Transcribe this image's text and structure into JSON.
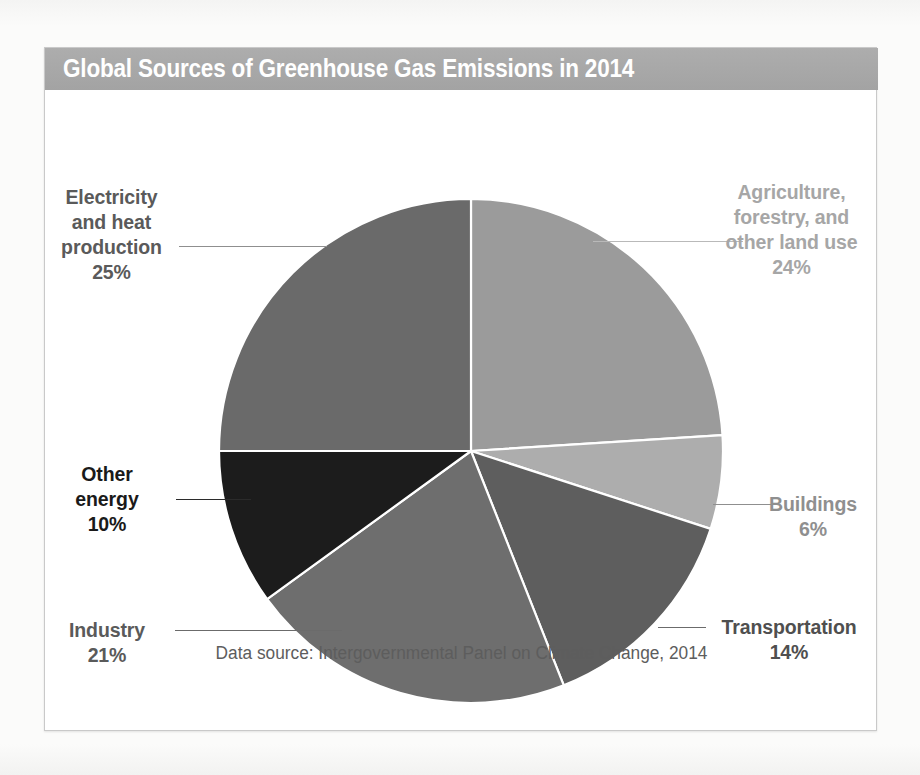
{
  "card": {
    "title": "Global Sources of Greenhouse Gas Emissions in 2014",
    "source_note": "Data source: Intergovernmental Panel on Climate Change, 2014"
  },
  "colors": {
    "banner": "#a8a8a8",
    "banner_text": "#ffffff",
    "card_bg": "#ffffff",
    "card_border": "#c9c9c9",
    "page_bg": "#fbfbfa",
    "slice_separator": "#ffffff",
    "source_note_text": "#5d5d5d"
  },
  "chart_data": {
    "type": "pie",
    "title": "Global Sources of Greenhouse Gas Emissions in 2014",
    "subtitle": "",
    "xlabel": "",
    "ylabel": "",
    "units": "percent of total global greenhouse gas emissions",
    "start_angle_deg": 0,
    "direction": "clockwise",
    "legend_position": "none",
    "grid": false,
    "annotation": "Data source: Intergovernmental Panel on Climate Change, 2014",
    "categories": [
      "Agriculture, forestry, and other land use",
      "Buildings",
      "Transportation",
      "Industry",
      "Other energy",
      "Electricity and heat production"
    ],
    "values": [
      24,
      6,
      14,
      21,
      10,
      25
    ],
    "total": 100,
    "slices": [
      {
        "id": "agriculture",
        "label_lines": [
          "Agriculture,",
          "forestry, and",
          "other land use"
        ],
        "label_text": "Agriculture, forestry, and other land use",
        "value": 24,
        "value_text": "24%",
        "color": "#9b9b9b",
        "label_color": "#a6a6a6",
        "leader_color": "#bdbdbd",
        "start_deg": 0,
        "end_deg": 86.4
      },
      {
        "id": "buildings",
        "label_lines": [
          "Buildings"
        ],
        "label_text": "Buildings",
        "value": 6,
        "value_text": "6%",
        "color": "#adadad",
        "label_color": "#8f8f8f",
        "leader_color": "#a8a8a8",
        "start_deg": 86.4,
        "end_deg": 108.0
      },
      {
        "id": "transportation",
        "label_lines": [
          "Transportation"
        ],
        "label_text": "Transportation",
        "value": 14,
        "value_text": "14%",
        "color": "#5e5e5e",
        "label_color": "#4f4f4f",
        "leader_color": "#6b6b6b",
        "start_deg": 108.0,
        "end_deg": 158.4
      },
      {
        "id": "industry",
        "label_lines": [
          "Industry"
        ],
        "label_text": "Industry",
        "value": 21,
        "value_text": "21%",
        "color": "#6e6e6e",
        "label_color": "#5a5a5a",
        "leader_color": "#7a7a7a",
        "start_deg": 158.4,
        "end_deg": 234.0
      },
      {
        "id": "other-energy",
        "label_lines": [
          "Other",
          "energy"
        ],
        "label_text": "Other energy",
        "value": 10,
        "value_text": "10%",
        "color": "#1c1c1c",
        "label_color": "#1a1a1a",
        "leader_color": "#2b2b2b",
        "start_deg": 234.0,
        "end_deg": 270.0
      },
      {
        "id": "electricity",
        "label_lines": [
          "Electricity",
          "and heat",
          "production"
        ],
        "label_text": "Electricity and heat production",
        "value": 25,
        "value_text": "25%",
        "color": "#6a6a6a",
        "label_color": "#5a5a5a",
        "leader_color": "#8f8f8f",
        "start_deg": 270.0,
        "end_deg": 360.0
      }
    ]
  }
}
